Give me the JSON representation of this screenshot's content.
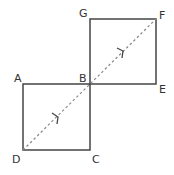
{
  "diagram": {
    "colors": {
      "edge": "#444444",
      "diagonal": "#888888",
      "label": "#333333",
      "background": "#ffffff"
    },
    "points": {
      "A": {
        "label": "A",
        "x": 23,
        "y": 84
      },
      "B": {
        "label": "B",
        "x": 90,
        "y": 84
      },
      "C": {
        "label": "C",
        "x": 90,
        "y": 150
      },
      "D": {
        "label": "D",
        "x": 23,
        "y": 150
      },
      "E": {
        "label": "E",
        "x": 156,
        "y": 84
      },
      "F": {
        "label": "F",
        "x": 156,
        "y": 19
      },
      "G": {
        "label": "G",
        "x": 90,
        "y": 19
      }
    },
    "squares": [
      {
        "name": "ABCD",
        "vertices": [
          "A",
          "B",
          "C",
          "D"
        ]
      },
      {
        "name": "GFEB",
        "vertices": [
          "G",
          "F",
          "E",
          "B"
        ]
      }
    ],
    "diagonal": {
      "from": "D",
      "to": "F",
      "style": "dashed",
      "arrows": 2,
      "direction": "D to F"
    }
  }
}
